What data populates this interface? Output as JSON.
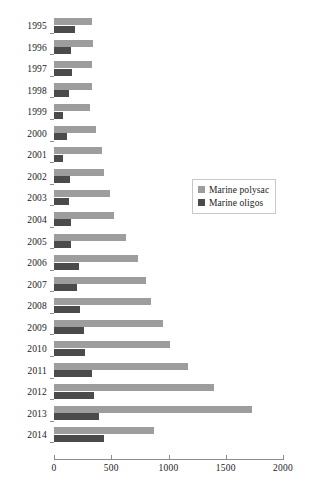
{
  "chart_data": {
    "type": "bar",
    "orientation": "horizontal",
    "title": "",
    "xlabel": "",
    "ylabel": "",
    "xlim": [
      0,
      2000
    ],
    "xticks": [
      0,
      500,
      1000,
      1500,
      2000
    ],
    "xtick_labels": [
      "0",
      "500",
      "1000",
      "1500",
      "2000"
    ],
    "grid": false,
    "legend_position": "center-right",
    "categories": [
      "1995",
      "1996",
      "1997",
      "1998",
      "1999",
      "2000",
      "2001",
      "2002",
      "2003",
      "2004",
      "2005",
      "2006",
      "2007",
      "2008",
      "2009",
      "2010",
      "2011",
      "2012",
      "2013",
      "2014"
    ],
    "series": [
      {
        "name": "Marine polysac",
        "color": "#9d9d9d",
        "values": [
          330,
          340,
          330,
          330,
          315,
          370,
          420,
          440,
          490,
          520,
          625,
          730,
          800,
          850,
          950,
          1010,
          1170,
          1400,
          1730,
          875
        ]
      },
      {
        "name": "Marine oligos",
        "color": "#4b4b4b",
        "values": [
          185,
          150,
          157,
          130,
          80,
          110,
          75,
          140,
          130,
          145,
          150,
          215,
          205,
          230,
          265,
          275,
          330,
          350,
          395,
          440
        ]
      }
    ]
  },
  "legend": {
    "items": [
      {
        "label": "Marine polysac",
        "color": "#9d9d9d"
      },
      {
        "label": "Marine oligos",
        "color": "#4b4b4b"
      }
    ]
  }
}
